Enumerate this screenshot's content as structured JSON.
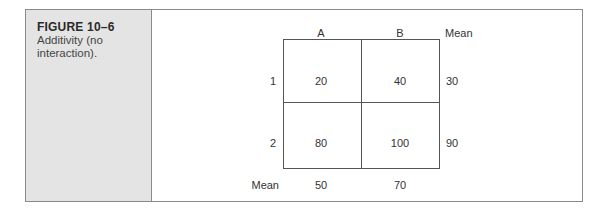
{
  "figure": {
    "label": "FIGURE 10–6",
    "caption": "Additivity (no interaction)."
  },
  "table": {
    "columns": [
      "A",
      "B"
    ],
    "mean_label": "Mean",
    "rows": [
      {
        "label": "1",
        "cells": [
          "20",
          "40"
        ],
        "mean": "30"
      },
      {
        "label": "2",
        "cells": [
          "80",
          "100"
        ],
        "mean": "90"
      }
    ],
    "column_means": [
      "50",
      "70"
    ]
  },
  "colors": {
    "sidebar_bg": "#e4e4e4",
    "border": "#8a8a8a",
    "grid_line": "#555555"
  }
}
